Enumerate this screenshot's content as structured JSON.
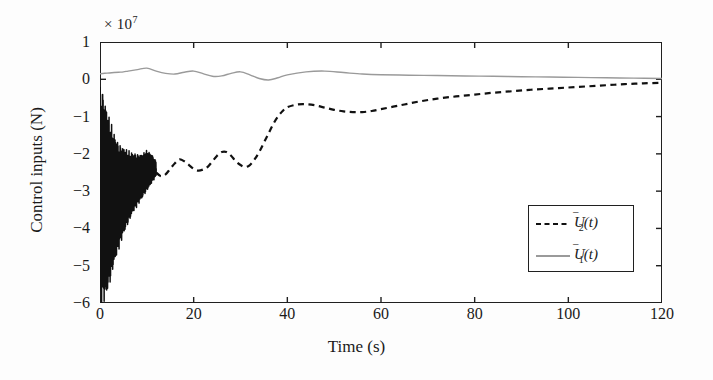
{
  "figure": {
    "background": "#fdfdfd",
    "frame_color": "#202020"
  },
  "axes": {
    "y_exponent_text": "× 10",
    "y_exponent_power": "7",
    "y_title": "Control inputs (N)",
    "x_title": "Time (s)",
    "y_ticklabels": [
      "1",
      "0",
      "−1",
      "−2",
      "−3",
      "−4",
      "−5",
      "−6"
    ],
    "x_ticklabels": [
      "0",
      "20",
      "40",
      "60",
      "80",
      "100",
      "120"
    ]
  },
  "legend": {
    "entries": [
      {
        "label_main": "U",
        "label_sub": "2",
        "label_arg": "(t)",
        "style": "dashed",
        "color": "#111111"
      },
      {
        "label_main": "U",
        "label_sub": "1",
        "label_arg": "(t)",
        "style": "solid",
        "color": "#9a9a9a"
      }
    ]
  },
  "chart_data": {
    "type": "line",
    "title": "",
    "subtitle": "",
    "xlabel": "Time (s)",
    "ylabel": "Control inputs (N)",
    "y_multiplier": 10000000.0,
    "y_multiplier_label": "× 10⁷",
    "xlim": [
      0,
      120
    ],
    "ylim": [
      -6,
      1
    ],
    "xticks": [
      0,
      20,
      40,
      60,
      80,
      100,
      120
    ],
    "yticks": [
      -6,
      -5,
      -4,
      -3,
      -2,
      -1,
      0,
      1
    ],
    "grid": false,
    "legend_position": "lower right",
    "annotations": [
      "High-frequency chattering transient in U2 during first ~10 s, envelope reaching the -6e7 clip at t=0 and decaying to about -2.3e7 by t=12 s",
      "Both control inputs converge toward 0 N as t approaches 120 s"
    ],
    "series": [
      {
        "name": "U2(t)",
        "style": "dashed",
        "color": "#111111",
        "linewidth": 2.2,
        "note": "Envelope values below are the oscillation centre after the chattering band; x in seconds, y in units of 1e7 N",
        "x": [
          0,
          1,
          2,
          3,
          4,
          5,
          6,
          7,
          8,
          9,
          10,
          11,
          12,
          13,
          14,
          15,
          16,
          17,
          18,
          19,
          20,
          21,
          22,
          23,
          24,
          25,
          26,
          27,
          28,
          29,
          30,
          31,
          32,
          33,
          34,
          35,
          36,
          37,
          38,
          39,
          40,
          42,
          44,
          46,
          48,
          50,
          52,
          54,
          56,
          58,
          60,
          64,
          68,
          72,
          76,
          80,
          84,
          88,
          92,
          96,
          100,
          104,
          108,
          112,
          116,
          120
        ],
        "y": [
          -3.0,
          -3.1,
          -3.05,
          -2.95,
          -2.8,
          -2.7,
          -2.6,
          -2.5,
          -2.4,
          -2.3,
          -2.1,
          -2.25,
          -2.5,
          -2.6,
          -2.55,
          -2.4,
          -2.25,
          -2.15,
          -2.2,
          -2.3,
          -2.4,
          -2.45,
          -2.42,
          -2.35,
          -2.2,
          -2.05,
          -1.95,
          -1.95,
          -2.05,
          -2.2,
          -2.3,
          -2.35,
          -2.3,
          -2.15,
          -1.95,
          -1.7,
          -1.45,
          -1.2,
          -1.0,
          -0.85,
          -0.75,
          -0.68,
          -0.67,
          -0.7,
          -0.76,
          -0.82,
          -0.86,
          -0.88,
          -0.88,
          -0.85,
          -0.8,
          -0.7,
          -0.6,
          -0.52,
          -0.46,
          -0.41,
          -0.36,
          -0.32,
          -0.28,
          -0.25,
          -0.22,
          -0.19,
          -0.16,
          -0.13,
          -0.11,
          -0.09
        ],
        "transient": {
          "t_start": 0,
          "t_end": 12,
          "envelope_min": [
            -6.0,
            -6.0,
            -5.6,
            -5.0,
            -4.6,
            -4.2,
            -3.9,
            -3.6,
            -3.4,
            -3.2,
            -3.0,
            -2.8,
            -2.6
          ],
          "envelope_max": [
            -0.1,
            -0.5,
            -1.0,
            -1.4,
            -1.7,
            -1.8,
            -1.9,
            -1.95,
            -2.0,
            -2.0,
            -1.9,
            -2.0,
            -2.2
          ],
          "oscillation_hz": 11
        }
      },
      {
        "name": "U1(t)",
        "style": "solid",
        "color": "#9a9a9a",
        "linewidth": 1.4,
        "x": [
          0,
          1,
          2,
          3,
          4,
          5,
          6,
          8,
          10,
          12,
          14,
          16,
          18,
          20,
          22,
          24,
          26,
          28,
          30,
          32,
          34,
          36,
          38,
          40,
          44,
          48,
          52,
          56,
          60,
          66,
          72,
          78,
          84,
          90,
          96,
          102,
          108,
          114,
          120
        ],
        "y": [
          0.15,
          0.16,
          0.17,
          0.18,
          0.19,
          0.2,
          0.22,
          0.26,
          0.3,
          0.22,
          0.16,
          0.14,
          0.19,
          0.22,
          0.15,
          0.08,
          0.09,
          0.16,
          0.2,
          0.12,
          0.02,
          -0.02,
          0.04,
          0.12,
          0.2,
          0.22,
          0.18,
          0.14,
          0.12,
          0.11,
          0.1,
          0.09,
          0.08,
          0.07,
          0.06,
          0.05,
          0.04,
          0.03,
          0.02
        ]
      }
    ]
  }
}
